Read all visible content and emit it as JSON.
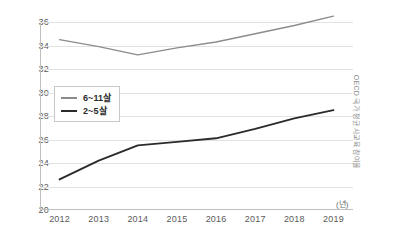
{
  "chart_data": {
    "type": "line",
    "title": "",
    "subtitle": "",
    "xlabel": "",
    "ylabel": "",
    "unit_label": "(년)",
    "side_caption": "OECD 국가 평균 사교육 참여율",
    "categories": [
      "2012",
      "2013",
      "2014",
      "2015",
      "2016",
      "2017",
      "2018",
      "2019"
    ],
    "ylim": [
      20,
      36
    ],
    "yticks": [
      20,
      22,
      24,
      26,
      28,
      30,
      32,
      34,
      36
    ],
    "ytick_labels": [
      "20",
      "22",
      "24",
      "26",
      "28",
      "30",
      "32",
      "34",
      "36"
    ],
    "grid": true,
    "grid_axis": "y",
    "legend_position": "inside-left-middle",
    "series": [
      {
        "name": "6~11살",
        "color": "#8c8c8c",
        "width": 1.4,
        "values": [
          34.5,
          33.9,
          33.2,
          33.8,
          34.3,
          35.0,
          35.7,
          36.5
        ]
      },
      {
        "name": "2~5살",
        "color": "#2b2b2b",
        "width": 1.9,
        "values": [
          22.6,
          24.2,
          25.5,
          25.8,
          26.1,
          26.9,
          27.8,
          28.5
        ]
      }
    ]
  },
  "colors": {
    "background": "#ffffff",
    "grid": "#e2e2e2",
    "axis": "#bfbfbf",
    "tick_text": "#5a5a5a",
    "legend_border": "#c9c9c9",
    "series_gray": "#8c8c8c",
    "series_black": "#2b2b2b"
  }
}
